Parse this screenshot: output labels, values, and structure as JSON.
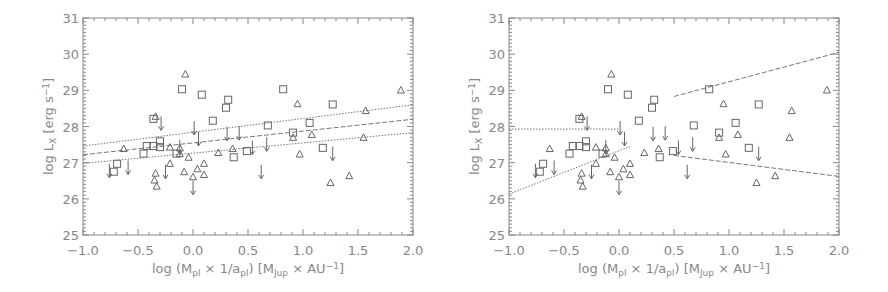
{
  "chart_data": [
    {
      "type": "scatter",
      "panel": "left",
      "title": "",
      "xlabel": "log (M_pl × 1/a_pl) [M_Jup × AU^-1]",
      "ylabel": "log L_X [erg s^-1]",
      "xlim": [
        -1.0,
        2.0
      ],
      "ylim": [
        25,
        31
      ],
      "xticks": [
        "-1.0",
        "-0.5",
        "0.0",
        "0.5",
        "1.0",
        "1.5",
        "2.0"
      ],
      "yticks": [
        "25",
        "26",
        "27",
        "28",
        "29",
        "30",
        "31"
      ],
      "grid": false,
      "legend": null,
      "series": [
        {
          "name": "squares",
          "marker": "square",
          "points": [
            [
              -0.1,
              29.03
            ],
            [
              0.08,
              28.88
            ],
            [
              0.32,
              28.74
            ],
            [
              0.3,
              28.52
            ],
            [
              0.82,
              29.03
            ],
            [
              1.27,
              28.61
            ],
            [
              0.18,
              28.16
            ],
            [
              -0.36,
              28.21
            ],
            [
              0.68,
              28.03
            ],
            [
              1.06,
              28.1
            ],
            [
              0.91,
              27.83
            ],
            [
              -0.3,
              27.59
            ],
            [
              -0.42,
              27.46
            ],
            [
              -0.36,
              27.46
            ],
            [
              -0.3,
              27.43
            ],
            [
              -0.45,
              27.25
            ],
            [
              -0.15,
              27.25
            ],
            [
              0.49,
              27.32
            ],
            [
              0.37,
              27.15
            ],
            [
              1.18,
              27.41
            ],
            [
              -0.69,
              26.97
            ],
            [
              -0.72,
              26.75
            ]
          ]
        },
        {
          "name": "triangles",
          "marker": "triangle",
          "points": [
            [
              -0.07,
              29.45
            ],
            [
              1.89,
              29.01
            ],
            [
              0.95,
              28.63
            ],
            [
              1.57,
              28.44
            ],
            [
              -0.34,
              28.28
            ],
            [
              1.08,
              27.78
            ],
            [
              1.55,
              27.7
            ],
            [
              0.91,
              27.7
            ],
            [
              -0.63,
              27.39
            ],
            [
              -0.21,
              27.43
            ],
            [
              -0.12,
              27.41
            ],
            [
              0.36,
              27.39
            ],
            [
              0.23,
              27.28
            ],
            [
              0.97,
              27.24
            ],
            [
              -0.12,
              27.25
            ],
            [
              -0.04,
              27.15
            ],
            [
              -0.21,
              26.98
            ],
            [
              0.1,
              26.98
            ],
            [
              0.04,
              26.83
            ],
            [
              -0.08,
              26.75
            ],
            [
              -0.34,
              26.71
            ],
            [
              0.1,
              26.67
            ],
            [
              0.0,
              26.61
            ],
            [
              -0.35,
              26.52
            ],
            [
              -0.33,
              26.35
            ],
            [
              1.25,
              26.45
            ],
            [
              1.42,
              26.64
            ]
          ]
        },
        {
          "name": "upper limits",
          "marker": "arrow-down",
          "points": [
            [
              -0.29,
              28.06
            ],
            [
              0.01,
              27.93
            ],
            [
              0.05,
              27.63
            ],
            [
              0.31,
              27.77
            ],
            [
              0.42,
              27.79
            ],
            [
              0.54,
              27.39
            ],
            [
              0.67,
              27.48
            ],
            [
              1.27,
              27.22
            ],
            [
              -0.76,
              26.75
            ],
            [
              -0.59,
              26.84
            ],
            [
              -0.25,
              26.72
            ],
            [
              0.0,
              26.28
            ],
            [
              0.62,
              26.72
            ],
            [
              -0.12,
              27.41
            ]
          ]
        }
      ],
      "lines": [
        {
          "name": "fit",
          "style": "dashed",
          "from": [
            -1.0,
            27.22
          ],
          "to": [
            2.0,
            28.2
          ]
        },
        {
          "name": "fit-upper",
          "style": "dotted",
          "from": [
            -1.0,
            27.46
          ],
          "to": [
            2.0,
            28.6
          ]
        },
        {
          "name": "fit-lower",
          "style": "dotted",
          "from": [
            -1.0,
            26.98
          ],
          "to": [
            2.0,
            27.83
          ]
        }
      ]
    },
    {
      "type": "scatter",
      "panel": "right",
      "title": "",
      "xlabel": "log (M_pl × 1/a_pl) [M_Jup × AU^-1]",
      "ylabel": "log L_X [erg s^-1]",
      "xlim": [
        -1.0,
        2.0
      ],
      "ylim": [
        25,
        31
      ],
      "xticks": [
        "-1.0",
        "-0.5",
        "0.0",
        "0.5",
        "1.0",
        "1.5",
        "2.0"
      ],
      "yticks": [
        "25",
        "26",
        "27",
        "28",
        "29",
        "30",
        "31"
      ],
      "grid": false,
      "legend": null,
      "series": "same as left panel",
      "lines": [
        {
          "name": "low-range-flat",
          "style": "dotted",
          "from": [
            -1.0,
            27.93
          ],
          "to": [
            0.0,
            27.93
          ]
        },
        {
          "name": "low-range-slope",
          "style": "dotted",
          "from": [
            -1.0,
            26.13
          ],
          "to": [
            0.1,
            27.45
          ]
        },
        {
          "name": "high-range-upper",
          "style": "dashed",
          "from": [
            0.5,
            28.83
          ],
          "to": [
            2.0,
            30.05
          ]
        },
        {
          "name": "high-range-lower",
          "style": "dashed",
          "from": [
            0.5,
            27.2
          ],
          "to": [
            2.0,
            26.62
          ]
        }
      ]
    }
  ],
  "labels": {
    "ylabel": "log L",
    "ylabel_sub": "X",
    "ylabel_unit": "[erg s",
    "ylabel_sup": "−1",
    "ylabel_close": "]",
    "xlabel_pre": "log (M",
    "xlabel_sub1": "pl",
    "xlabel_mid": " × 1/a",
    "xlabel_sub2": "pl",
    "xlabel_post": ")  [M",
    "xlabel_sub3": "Jup",
    "xlabel_unit": " × AU",
    "xlabel_sup": "−1",
    "xlabel_close": "]"
  },
  "colors": {
    "axis": "#888888",
    "marker": "#666666",
    "line": "#777777"
  }
}
